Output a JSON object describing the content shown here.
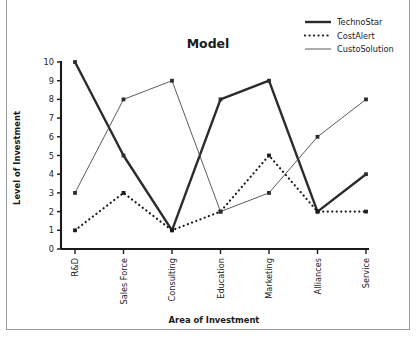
{
  "chart_data": {
    "type": "line",
    "title": "Model",
    "xlabel": "Area of Investment",
    "ylabel": "Level of Investment",
    "categories": [
      "R&D",
      "Sales Force",
      "Consulting",
      "Education",
      "Marketing",
      "Alliances",
      "Service"
    ],
    "yticks": [
      "0",
      "1",
      "2",
      "3",
      "4",
      "5",
      "6",
      "7",
      "8",
      "9",
      "10"
    ],
    "ylim": [
      0,
      10
    ],
    "grid": false,
    "legend_position": "top-right",
    "series": [
      {
        "name": "TechnoStar",
        "values": [
          10,
          5,
          1,
          8,
          9,
          2,
          4
        ],
        "style": "solid",
        "color": "#2b2b2b",
        "width": 2.4
      },
      {
        "name": "CostAlert",
        "values": [
          1,
          3,
          1,
          2,
          5,
          2,
          2
        ],
        "style": "dotted",
        "color": "#1a1a1a",
        "width": 2.2
      },
      {
        "name": "CustoSolution",
        "values": [
          3,
          8,
          9,
          2,
          3,
          6,
          8
        ],
        "style": "solid",
        "color": "#4a4a4a",
        "width": 0.9
      }
    ]
  },
  "figure": {
    "background": "#ffffff",
    "frame_color": "#9a9a9a"
  }
}
